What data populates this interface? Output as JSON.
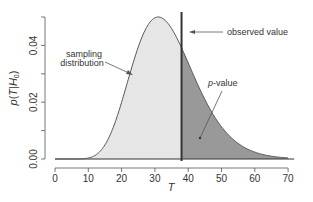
{
  "chart_data": {
    "type": "area",
    "title": "",
    "xlabel": "T",
    "ylabel_parts": {
      "p": "p",
      "open": "(",
      "T": "T",
      "bar": "|",
      "H": "H",
      "sub": "0",
      "close": ")"
    },
    "xlim": [
      0,
      72
    ],
    "ylim": [
      0,
      0.05
    ],
    "xticks": [
      0,
      10,
      20,
      30,
      40,
      50,
      60,
      70
    ],
    "xtick_labels": [
      "0",
      "10",
      "20",
      "30",
      "40",
      "50",
      "60",
      "70"
    ],
    "yticks": [
      0,
      0.01,
      0.02,
      0.03,
      0.04,
      0.05
    ],
    "ytick_labels": [
      "0.00",
      "",
      "0.02",
      "",
      "0.04",
      ""
    ],
    "distribution": {
      "kind": "gamma-like",
      "mode": 31,
      "peak_density": 0.05,
      "support_start": 10
    },
    "observed_value": 38,
    "annotations": [
      {
        "name": "observed-value",
        "text": "observed value"
      },
      {
        "name": "sampling-distribution",
        "lines": [
          "sampling",
          "distribution"
        ]
      },
      {
        "name": "p-value",
        "italic": "p",
        "text": "-value"
      }
    ],
    "colors": {
      "body_fill": "#e6e6e6",
      "tail_fill": "#999999",
      "curve": "#555555",
      "observed_line": "#333333",
      "axis": "#555555"
    }
  }
}
